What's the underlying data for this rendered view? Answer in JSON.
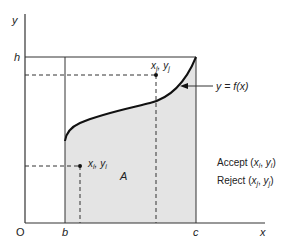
{
  "diagram": {
    "axes": {
      "x_label": "x",
      "y_label": "y",
      "origin_label": "O"
    },
    "bounds": {
      "lower_x_label": "b",
      "upper_x_label": "c",
      "height_label": "h"
    },
    "curve": {
      "label": "y = f(x)"
    },
    "region": {
      "label": "A"
    },
    "points": [
      {
        "name": "accepted-point",
        "label": "x",
        "sub": "i",
        "label2": "y",
        "sub2": "i"
      },
      {
        "name": "rejected-point",
        "label": "x",
        "sub": "j",
        "label2": "y",
        "sub2": "j"
      }
    ],
    "legend": {
      "accept_text": "Accept",
      "reject_text": "Reject"
    },
    "colors": {
      "line": "#222222",
      "shade": "#e4e4e4",
      "background": "#ffffff"
    }
  }
}
